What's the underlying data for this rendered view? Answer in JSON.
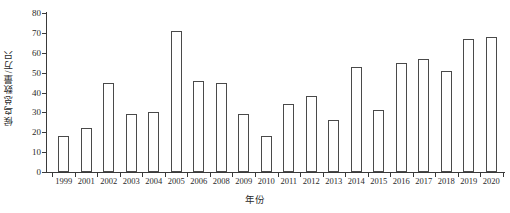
{
  "chart_data": {
    "type": "bar",
    "title": "",
    "xlabel": "年份",
    "ylabel": "候鸟总数量/万只",
    "categories": [
      "1999",
      "2001",
      "2002",
      "2003",
      "2004",
      "2005",
      "2006",
      "2008",
      "2009",
      "2010",
      "2011",
      "2012",
      "2013",
      "2014",
      "2015",
      "2016",
      "2017",
      "2018",
      "2019",
      "2020"
    ],
    "values": [
      18,
      22,
      45,
      29,
      30,
      71,
      46,
      45,
      29,
      18,
      34,
      38,
      26,
      53,
      31,
      55,
      57,
      51,
      67,
      68
    ],
    "ylim": [
      0,
      80
    ],
    "yticks": [
      0,
      10,
      20,
      30,
      40,
      50,
      60,
      70,
      80
    ],
    "ytick_labels": [
      "0",
      "10",
      "20",
      "30",
      "40",
      "50",
      "60",
      "70",
      "80"
    ],
    "grid": false,
    "legend": "none",
    "bar_facecolor": "#ffffff",
    "bar_edgecolor": "#4a4a4a",
    "axis_color": "#3a3a3a",
    "background": "#ffffff"
  }
}
